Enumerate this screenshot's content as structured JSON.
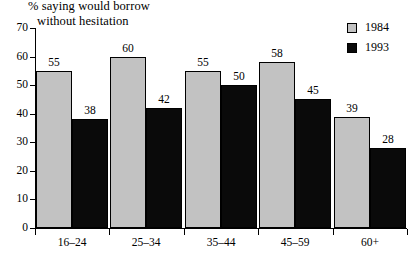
{
  "chart_data": {
    "type": "bar",
    "title": "% saying would borrow without hesitation",
    "title_line1": "% saying would borrow",
    "title_line2": "without hesitation",
    "xlabel": "",
    "ylabel": "",
    "ylim": [
      0,
      70
    ],
    "yticks": [
      0,
      10,
      20,
      30,
      40,
      50,
      60,
      70
    ],
    "grid": false,
    "legend_position": "top-right",
    "categories": [
      "16–24",
      "25–34",
      "35–44",
      "45–59",
      "60+"
    ],
    "series": [
      {
        "name": "1984",
        "color": "#c2c2c2",
        "values": [
          55,
          60,
          55,
          58,
          39
        ]
      },
      {
        "name": "1993",
        "color": "#0a0a0a",
        "values": [
          38,
          42,
          50,
          45,
          28
        ]
      }
    ]
  },
  "legend": {
    "items": [
      {
        "label": "1984",
        "swatch": "#c2c2c2"
      },
      {
        "label": "1993",
        "swatch": "#0a0a0a"
      }
    ]
  }
}
